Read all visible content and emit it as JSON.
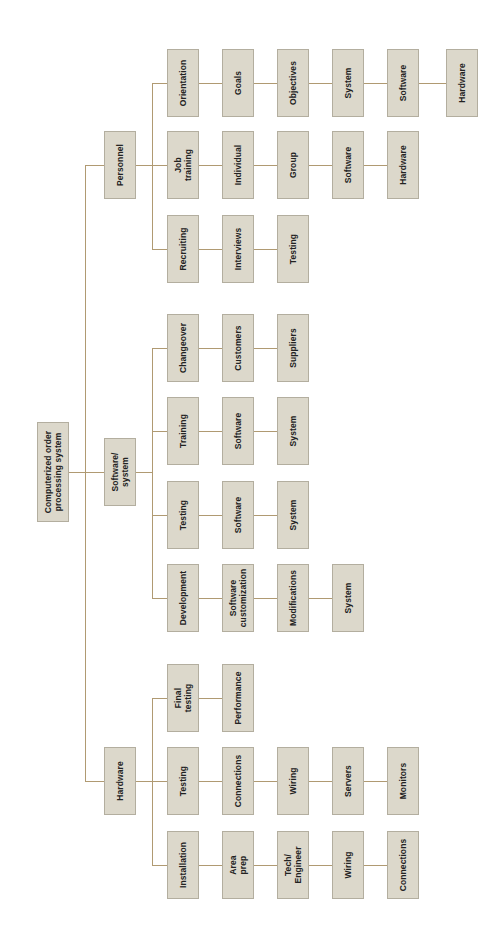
{
  "diagram": {
    "colors": {
      "box_fill": "#dcd8cb",
      "box_border": "#b3ae9f",
      "connector": "#b09a72",
      "text": "#222222",
      "background": "#ffffff"
    },
    "root": {
      "label": "Computerized order\nprocessing system"
    },
    "branches": [
      {
        "label": "Personnel",
        "children": [
          {
            "label": "Orientation",
            "chain": [
              "Goals",
              "Objectives",
              "System",
              "Software",
              "Hardware"
            ]
          },
          {
            "label": "Job\ntraining",
            "chain": [
              "Individual",
              "Group",
              "Software",
              "Hardware"
            ]
          },
          {
            "label": "Recruiting",
            "chain": [
              "Interviews",
              "Testing"
            ]
          }
        ]
      },
      {
        "label": "Software/\nsystem",
        "children": [
          {
            "label": "Changeover",
            "chain": [
              "Customers",
              "Suppliers"
            ]
          },
          {
            "label": "Training",
            "chain": [
              "Software",
              "System"
            ]
          },
          {
            "label": "Testing",
            "chain": [
              "Software",
              "System"
            ]
          },
          {
            "label": "Development",
            "chain": [
              "Software\ncustomization",
              "Modifications",
              "System"
            ]
          }
        ]
      },
      {
        "label": "Hardware",
        "children": [
          {
            "label": "Final\ntesting",
            "chain": [
              "Performance"
            ]
          },
          {
            "label": "Testing",
            "chain": [
              "Connections",
              "Wiring",
              "Servers",
              "Monitors"
            ]
          },
          {
            "label": "Installation",
            "chain": [
              "Area\nprep",
              "Tech/\nEngineer",
              "Wiring",
              "Connections"
            ]
          }
        ]
      }
    ]
  }
}
